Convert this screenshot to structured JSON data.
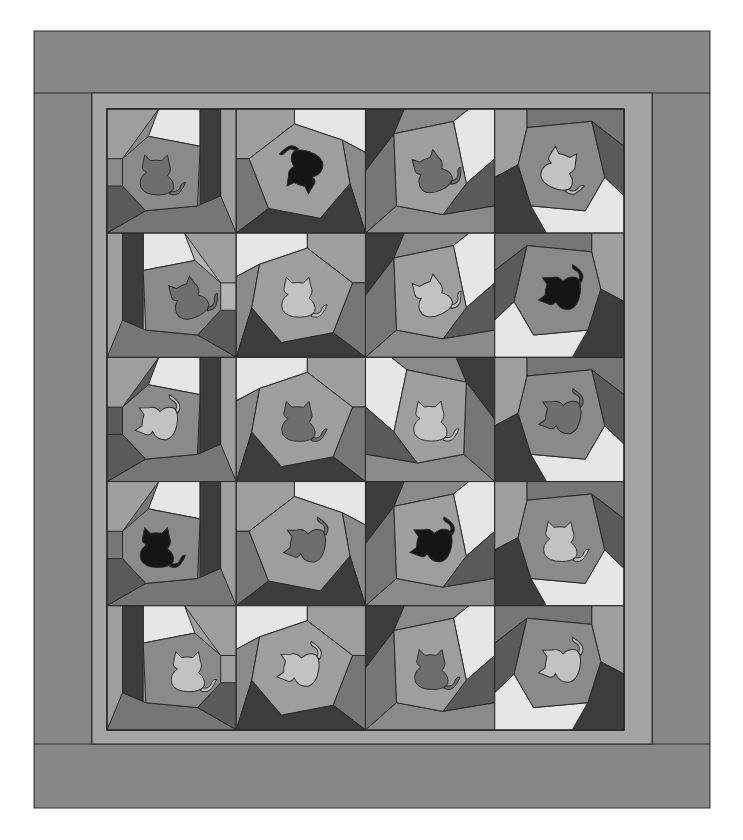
{
  "figure": {
    "layout": {
      "columns": 4,
      "rows": 5,
      "block_count": 20
    }
  },
  "palette": {
    "outer_border": "#878787",
    "inner_sashing": "#a4a4a4",
    "seam": "#2a2a2a",
    "tones": {
      "white": "#e6e6e6",
      "light": "#b4b4b4",
      "mid_light": "#9e9e9e",
      "mid": "#8a8a8a",
      "mid_dark": "#767676",
      "dark": "#5a5a5a",
      "darkest": "#3c3c3c"
    },
    "cat_shades": {
      "black": "#151515",
      "dark": "#6e6e6e",
      "light": "#c2c2c2"
    }
  },
  "blocks": [
    {
      "row": 1,
      "col": 1,
      "cat_shade": "dark",
      "cat_facing": "right"
    },
    {
      "row": 1,
      "col": 2,
      "cat_shade": "black",
      "cat_facing": "upside-left"
    },
    {
      "row": 1,
      "col": 3,
      "cat_shade": "dark",
      "cat_facing": "left-tilted"
    },
    {
      "row": 1,
      "col": 4,
      "cat_shade": "light",
      "cat_facing": "right-tilted"
    },
    {
      "row": 2,
      "col": 1,
      "cat_shade": "dark",
      "cat_facing": "left-tilted"
    },
    {
      "row": 2,
      "col": 2,
      "cat_shade": "light",
      "cat_facing": "right"
    },
    {
      "row": 2,
      "col": 3,
      "cat_shade": "light",
      "cat_facing": "left-tilted"
    },
    {
      "row": 2,
      "col": 4,
      "cat_shade": "black",
      "cat_facing": "sideways-right"
    },
    {
      "row": 3,
      "col": 1,
      "cat_shade": "light",
      "cat_facing": "sideways-right"
    },
    {
      "row": 3,
      "col": 2,
      "cat_shade": "dark",
      "cat_facing": "right"
    },
    {
      "row": 3,
      "col": 3,
      "cat_shade": "light",
      "cat_facing": "right"
    },
    {
      "row": 3,
      "col": 4,
      "cat_shade": "dark",
      "cat_facing": "sideways-right"
    },
    {
      "row": 4,
      "col": 1,
      "cat_shade": "black",
      "cat_facing": "right"
    },
    {
      "row": 4,
      "col": 2,
      "cat_shade": "dark",
      "cat_facing": "sideways-right"
    },
    {
      "row": 4,
      "col": 3,
      "cat_shade": "black",
      "cat_facing": "sideways-right"
    },
    {
      "row": 4,
      "col": 4,
      "cat_shade": "light",
      "cat_facing": "right"
    },
    {
      "row": 5,
      "col": 1,
      "cat_shade": "light",
      "cat_facing": "right"
    },
    {
      "row": 5,
      "col": 2,
      "cat_shade": "light",
      "cat_facing": "sideways-right"
    },
    {
      "row": 5,
      "col": 3,
      "cat_shade": "dark",
      "cat_facing": "right"
    },
    {
      "row": 5,
      "col": 4,
      "cat_shade": "light",
      "cat_facing": "sideways-right"
    }
  ]
}
